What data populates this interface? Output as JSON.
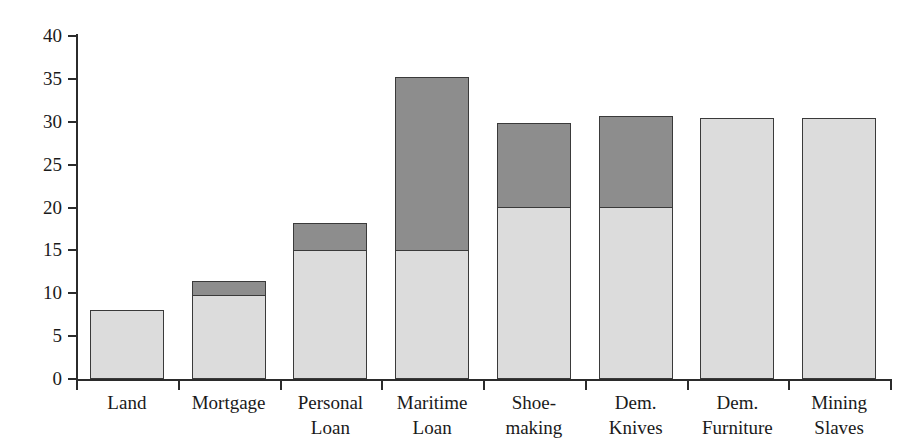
{
  "chart_data": {
    "type": "bar",
    "stacked": true,
    "title": "",
    "xlabel": "",
    "ylabel": "",
    "ylim": [
      0,
      40
    ],
    "y_ticks": [
      0,
      5,
      10,
      15,
      20,
      25,
      30,
      35,
      40
    ],
    "grid": false,
    "legend": null,
    "categories": [
      "Land",
      "Mortgage",
      "Personal\nLoan",
      "Maritime\nLoan",
      "Shoe-\nmaking",
      "Dem.\nKnives",
      "Dem.\nFurniture",
      "Mining\nSlaves"
    ],
    "series": [
      {
        "name": "lower-segment",
        "color": "#dcdcdc",
        "values": [
          8.1,
          9.9,
          15.1,
          15.1,
          20.1,
          20.1,
          30.4,
          30.4
        ]
      },
      {
        "name": "upper-segment",
        "color": "#8d8d8d",
        "values": [
          0,
          1.7,
          3.2,
          20.3,
          9.9,
          10.7,
          0,
          0
        ]
      }
    ],
    "totals": [
      8.1,
      11.6,
      18.3,
      35.4,
      30.0,
      30.8,
      30.4,
      30.4
    ],
    "colors": {
      "lower": "#dcdcdc",
      "upper": "#8d8d8d",
      "outline": "#3a3a3a",
      "axis": "#2b2b2b",
      "background": "#ffffff",
      "text": "#1a1a1a"
    }
  }
}
